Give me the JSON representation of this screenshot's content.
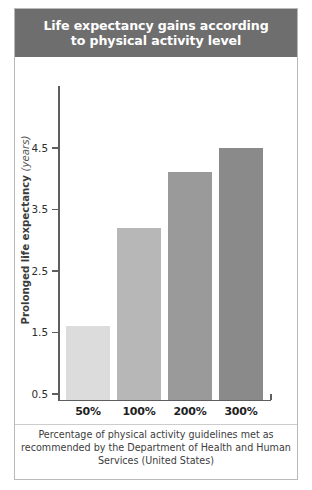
{
  "figure": {
    "title": "Life expectancy gains according to physical activity level",
    "title_line1": "Life expectancy gains according",
    "title_line2": "to physical activity level",
    "caption": "Percentage of physical activity guidelines met as recommended by the Department of Health and Human Services (United States)",
    "header_color": "#6e6e6e",
    "frame_color": "#b9b9b9",
    "axis_color": "#5e5e5e",
    "background": "#ffffff"
  },
  "chart_data": {
    "type": "bar",
    "title": "Life expectancy gains according to physical activity level",
    "xlabel": "Percentage of physical activity guidelines met as recommended by the Department of Health and Human Services (United States)",
    "ylabel": "Prolonged life expectancy (years)",
    "ylabel_main": "Prolonged life expectancy",
    "ylabel_unit": "(years)",
    "categories": [
      "50%",
      "100%",
      "200%",
      "300%"
    ],
    "values": [
      1.6,
      3.2,
      4.1,
      4.5
    ],
    "bar_colors": [
      "#dcdcdc",
      "#b7b7b7",
      "#9a9a9a",
      "#8a8a8a"
    ],
    "ytick_labels": [
      "0.5",
      "1.5",
      "2.5",
      "3.5",
      "4.5"
    ],
    "ytick_values": [
      0.5,
      1.5,
      2.5,
      3.5,
      4.5
    ],
    "ylim": [
      0.4,
      4.6
    ],
    "grid": false,
    "legend": false
  }
}
